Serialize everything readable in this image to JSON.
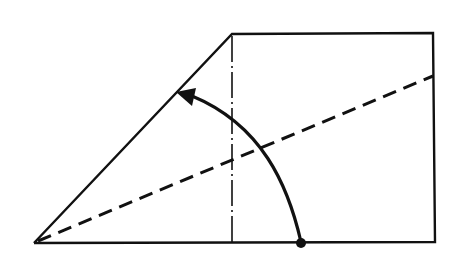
{
  "diagram": {
    "type": "origami-fold-step",
    "background": "#ffffff",
    "stroke_color": "#111111",
    "shapes": {
      "outline": {
        "description": "Paper outline: triangle flap on left joined to square on right",
        "points": [
          [
            34,
            243
          ],
          [
            232,
            34
          ],
          [
            433,
            33
          ],
          [
            435,
            242
          ],
          [
            34,
            243
          ]
        ]
      },
      "square_left_edge": {
        "style": "dash-dot (fold/hidden edge)",
        "from": [
          232,
          34
        ],
        "to": [
          232,
          243
        ]
      },
      "valley_fold_line": {
        "style": "dashed",
        "from": [
          36,
          242
        ],
        "to": [
          433,
          76
        ]
      },
      "fold_arrow": {
        "description": "Curved arrow from bottom-edge point up to left slanted edge",
        "start_point": [
          301,
          243
        ],
        "control": [
          270,
          120
        ],
        "end_point": [
          180,
          92
        ],
        "start_marker": "dot",
        "end_marker": "filled-arrowhead"
      }
    }
  }
}
